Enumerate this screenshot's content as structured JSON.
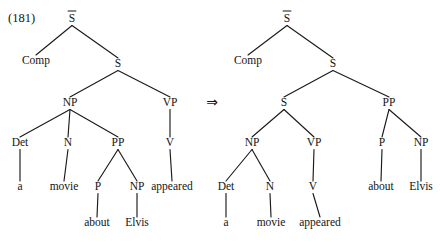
{
  "figure": {
    "number_label": "(181)",
    "arrow_glyph": "⇒",
    "arrow_name": "double-right-arrow"
  },
  "trees": [
    {
      "id": "source-tree",
      "name": "deep-structure-tree",
      "nodes": [
        {
          "id": "L-Sbar",
          "label": "S",
          "bar": true,
          "x": 72,
          "y": 22,
          "kind": "category"
        },
        {
          "id": "L-Comp",
          "label": "Comp",
          "bar": false,
          "x": 36,
          "y": 64,
          "kind": "category"
        },
        {
          "id": "L-S",
          "label": "S",
          "bar": false,
          "x": 118,
          "y": 67,
          "kind": "category"
        },
        {
          "id": "L-NP",
          "label": "NP",
          "bar": false,
          "x": 70,
          "y": 106,
          "kind": "category"
        },
        {
          "id": "L-VP",
          "label": "VP",
          "bar": false,
          "x": 170,
          "y": 106,
          "kind": "category"
        },
        {
          "id": "L-Det",
          "label": "Det",
          "bar": false,
          "x": 20,
          "y": 146,
          "kind": "category"
        },
        {
          "id": "L-N",
          "label": "N",
          "bar": false,
          "x": 68,
          "y": 146,
          "kind": "category"
        },
        {
          "id": "L-PP",
          "label": "PP",
          "bar": false,
          "x": 118,
          "y": 146,
          "kind": "category"
        },
        {
          "id": "L-V",
          "label": "V",
          "bar": false,
          "x": 170,
          "y": 146,
          "kind": "category"
        },
        {
          "id": "L-a",
          "label": "a",
          "bar": false,
          "x": 20,
          "y": 190,
          "kind": "word"
        },
        {
          "id": "L-movie",
          "label": "movie",
          "bar": false,
          "x": 64,
          "y": 190,
          "kind": "word"
        },
        {
          "id": "L-P",
          "label": "P",
          "bar": false,
          "x": 98,
          "y": 190,
          "kind": "category"
        },
        {
          "id": "L-NP2",
          "label": "NP",
          "bar": false,
          "x": 137,
          "y": 190,
          "kind": "category"
        },
        {
          "id": "L-appeared",
          "label": "appeared",
          "bar": false,
          "x": 172,
          "y": 190,
          "kind": "word"
        },
        {
          "id": "L-about",
          "label": "about",
          "bar": false,
          "x": 97,
          "y": 226,
          "kind": "word"
        },
        {
          "id": "L-Elvis",
          "label": "Elvis",
          "bar": false,
          "x": 137,
          "y": 226,
          "kind": "word"
        }
      ],
      "edges": [
        [
          "L-Sbar",
          "L-Comp"
        ],
        [
          "L-Sbar",
          "L-S"
        ],
        [
          "L-S",
          "L-NP"
        ],
        [
          "L-S",
          "L-VP"
        ],
        [
          "L-NP",
          "L-Det"
        ],
        [
          "L-NP",
          "L-N"
        ],
        [
          "L-NP",
          "L-PP"
        ],
        [
          "L-VP",
          "L-V"
        ],
        [
          "L-Det",
          "L-a"
        ],
        [
          "L-N",
          "L-movie"
        ],
        [
          "L-PP",
          "L-P"
        ],
        [
          "L-PP",
          "L-NP2"
        ],
        [
          "L-V",
          "L-appeared"
        ],
        [
          "L-P",
          "L-about"
        ],
        [
          "L-NP2",
          "L-Elvis"
        ]
      ]
    },
    {
      "id": "derived-tree",
      "name": "surface-structure-tree",
      "nodes": [
        {
          "id": "R-Sbar",
          "label": "S",
          "bar": true,
          "x": 287,
          "y": 22,
          "kind": "category"
        },
        {
          "id": "R-Comp",
          "label": "Comp",
          "bar": false,
          "x": 248,
          "y": 64,
          "kind": "category"
        },
        {
          "id": "R-S1",
          "label": "S",
          "bar": false,
          "x": 333,
          "y": 67,
          "kind": "category"
        },
        {
          "id": "R-S2",
          "label": "S",
          "bar": false,
          "x": 284,
          "y": 106,
          "kind": "category"
        },
        {
          "id": "R-PP",
          "label": "PP",
          "bar": false,
          "x": 389,
          "y": 106,
          "kind": "category"
        },
        {
          "id": "R-NP",
          "label": "NP",
          "bar": false,
          "x": 252,
          "y": 146,
          "kind": "category"
        },
        {
          "id": "R-VP",
          "label": "VP",
          "bar": false,
          "x": 314,
          "y": 146,
          "kind": "category"
        },
        {
          "id": "R-P",
          "label": "P",
          "bar": false,
          "x": 382,
          "y": 146,
          "kind": "category"
        },
        {
          "id": "R-NP2",
          "label": "NP",
          "bar": false,
          "x": 421,
          "y": 146,
          "kind": "category"
        },
        {
          "id": "R-Det",
          "label": "Det",
          "bar": false,
          "x": 226,
          "y": 190,
          "kind": "category"
        },
        {
          "id": "R-N",
          "label": "N",
          "bar": false,
          "x": 270,
          "y": 190,
          "kind": "category"
        },
        {
          "id": "R-V",
          "label": "V",
          "bar": false,
          "x": 313,
          "y": 190,
          "kind": "category"
        },
        {
          "id": "R-about",
          "label": "about",
          "bar": false,
          "x": 381,
          "y": 190,
          "kind": "word"
        },
        {
          "id": "R-Elvis",
          "label": "Elvis",
          "bar": false,
          "x": 421,
          "y": 190,
          "kind": "word"
        },
        {
          "id": "R-a",
          "label": "a",
          "bar": false,
          "x": 226,
          "y": 226,
          "kind": "word"
        },
        {
          "id": "R-movie",
          "label": "movie",
          "bar": false,
          "x": 271,
          "y": 226,
          "kind": "word"
        },
        {
          "id": "R-appeared",
          "label": "appeared",
          "bar": false,
          "x": 320,
          "y": 226,
          "kind": "word"
        }
      ],
      "edges": [
        [
          "R-Sbar",
          "R-Comp"
        ],
        [
          "R-Sbar",
          "R-S1"
        ],
        [
          "R-S1",
          "R-S2"
        ],
        [
          "R-S1",
          "R-PP"
        ],
        [
          "R-S2",
          "R-NP"
        ],
        [
          "R-S2",
          "R-VP"
        ],
        [
          "R-PP",
          "R-P"
        ],
        [
          "R-PP",
          "R-NP2"
        ],
        [
          "R-NP",
          "R-Det"
        ],
        [
          "R-NP",
          "R-N"
        ],
        [
          "R-VP",
          "R-V"
        ],
        [
          "R-P",
          "R-about"
        ],
        [
          "R-NP2",
          "R-Elvis"
        ],
        [
          "R-Det",
          "R-a"
        ],
        [
          "R-N",
          "R-movie"
        ],
        [
          "R-V",
          "R-appeared"
        ]
      ]
    }
  ],
  "arrow_position": {
    "x": 212,
    "y": 107
  },
  "figure_number_position": {
    "x": 8,
    "y": 22
  },
  "colors": {
    "ink": "#141414",
    "edge": "#1b1b1b",
    "background": "#ffffff"
  }
}
